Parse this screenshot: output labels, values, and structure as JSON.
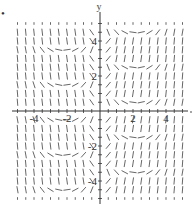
{
  "chart_data": {
    "type": "slope-field",
    "title": "",
    "xlabel": "",
    "ylabel": "y",
    "xlim": [
      -5.3,
      5.3
    ],
    "ylim": [
      -5.3,
      5.3
    ],
    "x_ticks": [
      -4,
      -2,
      2,
      4
    ],
    "y_ticks": [
      -4,
      -2,
      2,
      4
    ],
    "x_tick_labels": [
      "-4",
      "-2",
      "2",
      "4"
    ],
    "y_tick_labels": [
      "-4",
      "-2",
      "2",
      "4"
    ],
    "grid": false,
    "marker_label": "•",
    "axis_color": "#333333",
    "segment_color": "#555555",
    "columns_x": [
      -5,
      -4.5,
      -4,
      -3.5,
      -3,
      -2.5,
      -2,
      -1.5,
      -1,
      -0.5,
      0.5,
      1,
      1.5,
      2,
      2.5,
      3,
      3.5,
      4,
      4.5,
      5
    ],
    "rows": [
      {
        "y": 5.0,
        "left": "dot",
        "right": "dot"
      },
      {
        "y": 4.5,
        "left": "steep-neg",
        "right": "transition"
      },
      {
        "y": 4.0,
        "left": "steep-neg",
        "right": "steep-pos"
      },
      {
        "y": 3.5,
        "left": "transition",
        "right": "steep-pos"
      },
      {
        "y": 3.0,
        "left": "steep-neg",
        "right": "steep-pos"
      },
      {
        "y": 2.5,
        "left": "steep-neg",
        "right": "transition"
      },
      {
        "y": 2.0,
        "left": "steep-neg",
        "right": "steep-pos"
      },
      {
        "y": 1.5,
        "left": "transition",
        "right": "steep-pos"
      },
      {
        "y": 1.0,
        "left": "steep-neg",
        "right": "steep-pos"
      },
      {
        "y": 0.5,
        "left": "steep-neg",
        "right": "transition"
      },
      {
        "y": -0.5,
        "left": "transition",
        "right": "steep-pos"
      },
      {
        "y": -1.0,
        "left": "steep-neg",
        "right": "steep-pos"
      },
      {
        "y": -1.5,
        "left": "steep-neg",
        "right": "transition"
      },
      {
        "y": -2.0,
        "left": "steep-neg",
        "right": "steep-pos"
      },
      {
        "y": -2.5,
        "left": "transition",
        "right": "steep-pos"
      },
      {
        "y": -3.0,
        "left": "steep-neg",
        "right": "steep-pos"
      },
      {
        "y": -3.5,
        "left": "steep-neg",
        "right": "transition"
      },
      {
        "y": -4.0,
        "left": "steep-neg",
        "right": "steep-pos"
      },
      {
        "y": -4.5,
        "left": "transition",
        "right": "steep-pos"
      },
      {
        "y": -5.0,
        "left": "dot",
        "right": "dot"
      }
    ]
  }
}
